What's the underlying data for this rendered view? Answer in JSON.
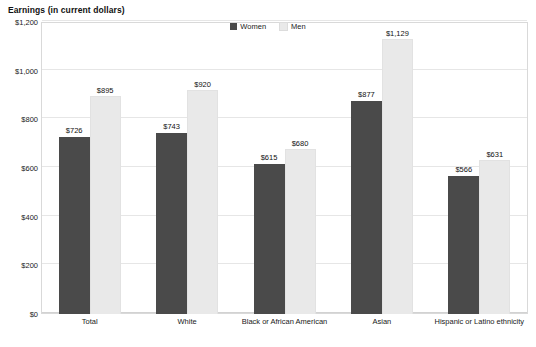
{
  "chart_data": {
    "type": "bar",
    "title": "Earnings (in current dollars)",
    "xlabel": "",
    "ylabel": "",
    "categories": [
      "Total",
      "White",
      "Black or African American",
      "Asian",
      "Hispanic or Latino ethnicity"
    ],
    "series": [
      {
        "name": "Women",
        "color": "#4a4a4a",
        "values": [
          726,
          743,
          615,
          877,
          566
        ],
        "labels": [
          "$726",
          "$743",
          "$615",
          "$877",
          "$566"
        ]
      },
      {
        "name": "Men",
        "color": "#e9e9e9",
        "values": [
          895,
          920,
          680,
          1129,
          631
        ],
        "labels": [
          "$895",
          "$920",
          "$680",
          "$1,129",
          "$631"
        ]
      }
    ],
    "ylim": [
      0,
      1200
    ],
    "yticks": [
      0,
      200,
      400,
      600,
      800,
      1000,
      1200
    ],
    "ytick_labels": [
      "$0",
      "$200",
      "$400",
      "$600",
      "$800",
      "$1,000",
      "$1,200"
    ],
    "grid": true,
    "legend_position": "top-center"
  },
  "legend": {
    "entries": [
      {
        "label": "Women",
        "color": "#4a4a4a"
      },
      {
        "label": "Men",
        "color": "#e9e9e9"
      }
    ]
  }
}
